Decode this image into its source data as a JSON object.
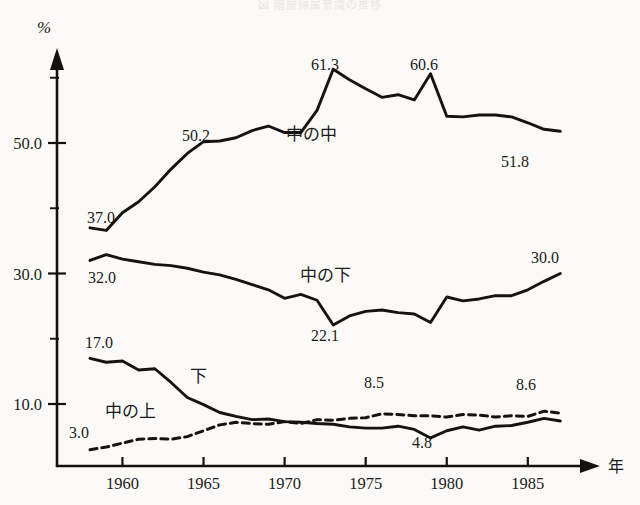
{
  "figure": {
    "title": "図 階層帰属意識の推移",
    "unit_label": "%",
    "x_axis_name": "年"
  },
  "chart_data": {
    "type": "line",
    "title": "図 階層帰属意識の推移",
    "xlabel": "年",
    "ylabel": "%",
    "xlim": [
      1958,
      1987
    ],
    "ylim": [
      0,
      66
    ],
    "grid": false,
    "legend": "inline-labels",
    "xticks": [
      1960,
      1965,
      1970,
      1975,
      1980,
      1985
    ],
    "xtick_labels": [
      "1960",
      "1965",
      "1970",
      "1975",
      "1980",
      "1985"
    ],
    "yticks": [
      10.0,
      30.0,
      50.0
    ],
    "ytick_labels": [
      "10.0",
      "30.0",
      "50.0"
    ],
    "yticks_minor": [
      20.0,
      40.0,
      60.0
    ],
    "x": [
      1958,
      1959,
      1960,
      1961,
      1962,
      1963,
      1964,
      1965,
      1966,
      1967,
      1968,
      1969,
      1970,
      1971,
      1972,
      1973,
      1974,
      1975,
      1976,
      1977,
      1978,
      1979,
      1980,
      1981,
      1982,
      1983,
      1984,
      1985,
      1986,
      1987
    ],
    "series": [
      {
        "name": "中の中",
        "style": "solid",
        "values": [
          37.0,
          36.6,
          39.3,
          41.0,
          43.3,
          46.0,
          48.4,
          50.2,
          50.3,
          50.8,
          51.9,
          52.6,
          51.6,
          51.6,
          55.0,
          61.3,
          59.7,
          58.3,
          57.0,
          57.4,
          56.6,
          60.6,
          54.1,
          54.0,
          54.3,
          54.3,
          54.0,
          53.1,
          52.1,
          51.8
        ]
      },
      {
        "name": "中の下",
        "style": "solid",
        "values": [
          32.0,
          32.9,
          32.2,
          31.8,
          31.4,
          31.2,
          30.8,
          30.2,
          29.8,
          29.1,
          28.3,
          27.5,
          26.2,
          26.8,
          25.9,
          22.1,
          23.5,
          24.2,
          24.4,
          24.0,
          23.8,
          22.5,
          26.4,
          25.8,
          26.1,
          26.6,
          26.6,
          27.5,
          28.8,
          30.0
        ]
      },
      {
        "name": "中の上",
        "style": "dashed",
        "values": [
          3.0,
          3.4,
          4.0,
          4.6,
          4.7,
          4.6,
          5.0,
          5.9,
          6.8,
          7.2,
          7.0,
          6.9,
          7.3,
          7.0,
          7.6,
          7.5,
          7.8,
          7.9,
          8.5,
          8.4,
          8.2,
          8.2,
          8.0,
          8.4,
          8.3,
          8.0,
          8.2,
          8.1,
          8.9,
          8.6
        ]
      },
      {
        "name": "下",
        "style": "solid",
        "values": [
          17.0,
          16.4,
          16.6,
          15.2,
          15.4,
          13.3,
          11.0,
          9.9,
          8.7,
          8.1,
          7.6,
          7.7,
          7.3,
          7.2,
          7.0,
          6.9,
          6.5,
          6.3,
          6.3,
          6.6,
          6.1,
          4.8,
          5.9,
          6.5,
          6.0,
          6.6,
          6.7,
          7.2,
          7.8,
          7.4
        ]
      }
    ],
    "annotations": [
      {
        "text": "37.0",
        "series": "中の中",
        "x": 1958,
        "value": 37.0
      },
      {
        "text": "50.2",
        "series": "中の中",
        "x": 1965,
        "value": 50.2
      },
      {
        "text": "61.3",
        "series": "中の中",
        "x": 1973,
        "value": 61.3
      },
      {
        "text": "60.6",
        "series": "中の中",
        "x": 1979,
        "value": 60.6
      },
      {
        "text": "51.8",
        "series": "中の中",
        "x": 1987,
        "value": 51.8
      },
      {
        "text": "32.0",
        "series": "中の下",
        "x": 1958,
        "value": 32.0
      },
      {
        "text": "22.1",
        "series": "中の下",
        "x": 1973,
        "value": 22.1
      },
      {
        "text": "30.0",
        "series": "中の下",
        "x": 1987,
        "value": 30.0
      },
      {
        "text": "17.0",
        "series": "下",
        "x": 1958,
        "value": 17.0
      },
      {
        "text": "4.8",
        "series": "下",
        "x": 1979,
        "value": 4.8
      },
      {
        "text": "3.0",
        "series": "中の上",
        "x": 1958,
        "value": 3.0
      },
      {
        "text": "8.5",
        "series": "中の上",
        "x": 1976,
        "value": 8.5
      },
      {
        "text": "8.6",
        "series": "中の上",
        "x": 1987,
        "value": 8.6
      }
    ]
  }
}
